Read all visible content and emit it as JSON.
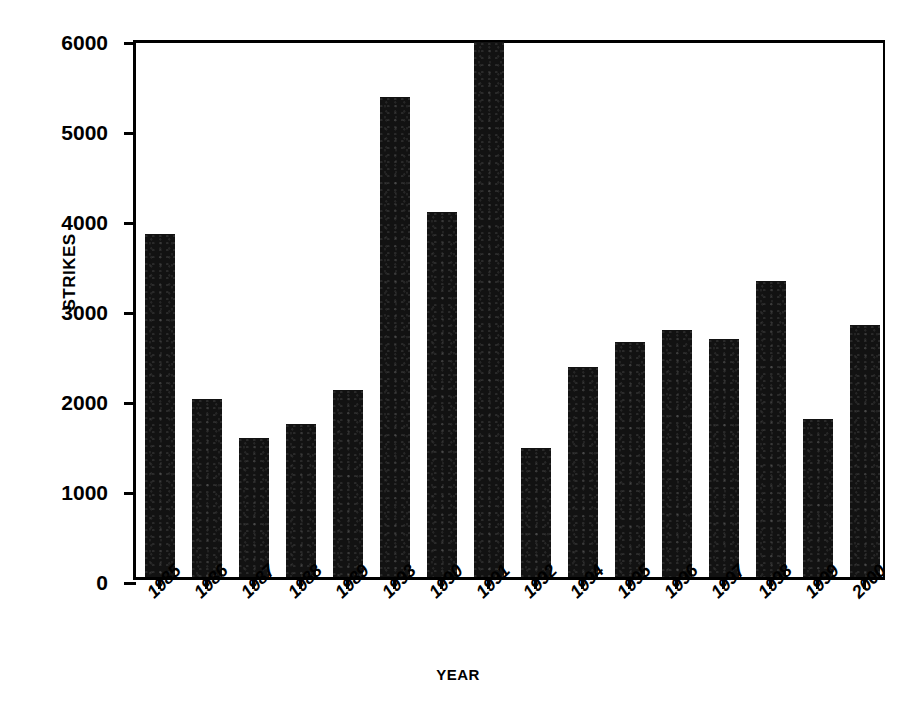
{
  "chart_data": {
    "type": "bar",
    "title": "",
    "xlabel": "YEAR",
    "ylabel": "STRIKES",
    "categories": [
      "1985",
      "1986",
      "1987",
      "1988",
      "1989",
      "1993",
      "1990",
      "1991",
      "1992",
      "1994",
      "1995",
      "1996",
      "1997",
      "1998",
      "1999",
      "2000"
    ],
    "values": [
      3810,
      1980,
      1550,
      1700,
      2080,
      5330,
      4060,
      5950,
      1430,
      2330,
      2610,
      2740,
      2650,
      3290,
      1760,
      2800
    ],
    "ylim": [
      0,
      6000
    ],
    "yticks": [
      0,
      1000,
      2000,
      3000,
      4000,
      5000,
      6000
    ],
    "ytick_labels": [
      "0",
      "1000",
      "2000",
      "3000",
      "4000",
      "5000",
      "6000"
    ],
    "grid": false,
    "legend": null,
    "bar_color": "#121212",
    "axis_color": "#000000",
    "background": "#ffffff"
  }
}
